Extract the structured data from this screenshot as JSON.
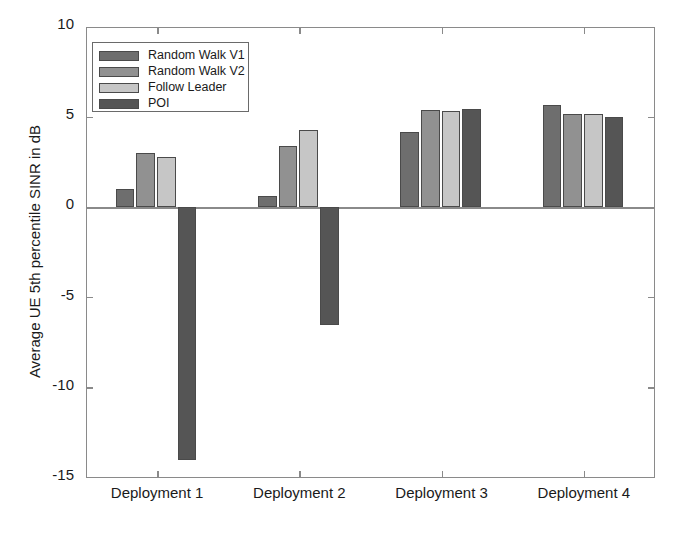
{
  "chart_data": {
    "type": "bar",
    "title": "",
    "xlabel": "",
    "ylabel": "Average UE 5th percentile SINR in dB",
    "ylim": [
      -15,
      10
    ],
    "yticks": [
      10,
      5,
      0,
      -5,
      -10,
      -15
    ],
    "ytick_labels": [
      "10",
      "5",
      "0",
      "-5",
      "-10",
      "-15"
    ],
    "grid": false,
    "legend_position": "upper left (inside axes)",
    "categories": [
      "Deployment 1",
      "Deployment 2",
      "Deployment 3",
      "Deployment 4"
    ],
    "series": [
      {
        "name": "Random Walk V1",
        "color": "#6e6e6e",
        "values": [
          1.0,
          0.65,
          4.2,
          5.7
        ]
      },
      {
        "name": "Random Walk V2",
        "color": "#919191",
        "values": [
          3.0,
          3.4,
          5.4,
          5.2
        ]
      },
      {
        "name": "Follow Leader",
        "color": "#c6c6c6",
        "values": [
          2.8,
          4.3,
          5.35,
          5.2
        ]
      },
      {
        "name": "POI",
        "color": "#555555",
        "values": [
          -14.0,
          -6.5,
          5.45,
          5.0
        ]
      }
    ]
  },
  "axis": {
    "line_color": "#8a8a8a",
    "background": "#ffffff"
  }
}
